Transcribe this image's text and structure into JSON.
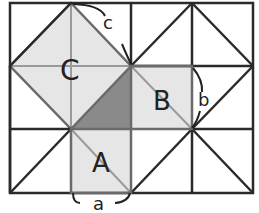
{
  "diagram": {
    "labels": {
      "square_c": "C",
      "square_b": "B",
      "square_a": "A",
      "side_c": "c",
      "side_b": "b",
      "side_a": "a"
    },
    "grid": {
      "columns": 4,
      "rows": 3
    },
    "colors": {
      "grid_line": "#2a2a2a",
      "light_fill": "#e6e6e6",
      "dark_triangle": "#8a8a8a",
      "inner_line": "#9a9a9a",
      "background": "#ffffff"
    }
  }
}
